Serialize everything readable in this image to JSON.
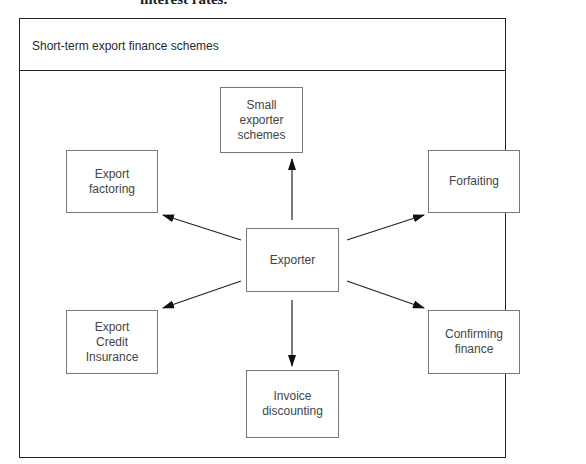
{
  "cropped_text_above": "interest rates.",
  "diagram": {
    "title": "Short-term export finance schemes",
    "center": {
      "label": "Exporter"
    },
    "nodes": [
      {
        "id": "small-exporter-schemes",
        "label": "Small\nexporter\nschemes"
      },
      {
        "id": "export-factoring",
        "label": "Export\nfactoring"
      },
      {
        "id": "forfaiting",
        "label": "Forfaiting"
      },
      {
        "id": "export-credit-insurance",
        "label": "Export\nCredit\nInsurance"
      },
      {
        "id": "confirming-finance",
        "label": "Confirming\nfinance"
      },
      {
        "id": "invoice-discounting",
        "label": "Invoice\ndiscounting"
      }
    ],
    "edges": [
      {
        "from": "Exporter",
        "to": "Small exporter schemes"
      },
      {
        "from": "Exporter",
        "to": "Export factoring"
      },
      {
        "from": "Exporter",
        "to": "Forfaiting"
      },
      {
        "from": "Exporter",
        "to": "Export Credit Insurance"
      },
      {
        "from": "Exporter",
        "to": "Confirming finance"
      },
      {
        "from": "Exporter",
        "to": "Invoice discounting"
      }
    ]
  }
}
